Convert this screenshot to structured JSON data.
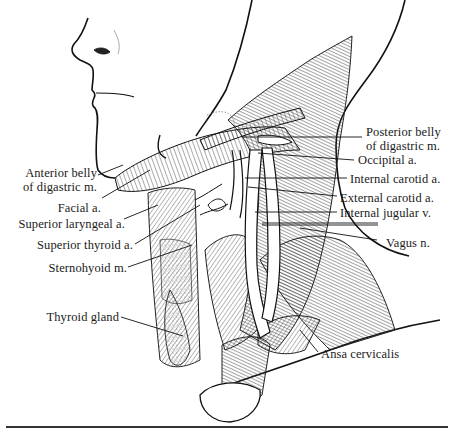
{
  "figure": {
    "labels_right": [
      {
        "id": "posterior-belly-digastric",
        "lines": [
          "Posterior belly",
          "of digastric m."
        ]
      },
      {
        "id": "occipital-a",
        "lines": [
          "Occipital a."
        ]
      },
      {
        "id": "internal-carotid-a",
        "lines": [
          "Internal carotid a."
        ]
      },
      {
        "id": "external-carotid-a",
        "lines": [
          "External carotid a."
        ]
      },
      {
        "id": "internal-jugular-v",
        "lines": [
          "Internal jugular v."
        ]
      },
      {
        "id": "vagus-n",
        "lines": [
          "Vagus n."
        ]
      },
      {
        "id": "ansa-cervicalis",
        "lines": [
          "Ansa cervicalis"
        ]
      }
    ],
    "labels_left": [
      {
        "id": "anterior-belly-digastric",
        "lines": [
          "Anterior belly",
          "of digastric m."
        ]
      },
      {
        "id": "facial-a",
        "lines": [
          "Facial a."
        ]
      },
      {
        "id": "superior-laryngeal-a",
        "lines": [
          "Superior laryngeal a."
        ]
      },
      {
        "id": "superior-thyroid-a",
        "lines": [
          "Superior thyroid a."
        ]
      },
      {
        "id": "sternohyoid-m",
        "lines": [
          "Sternohyoid m."
        ]
      },
      {
        "id": "thyroid-gland",
        "lines": [
          "Thyroid gland"
        ]
      }
    ]
  }
}
